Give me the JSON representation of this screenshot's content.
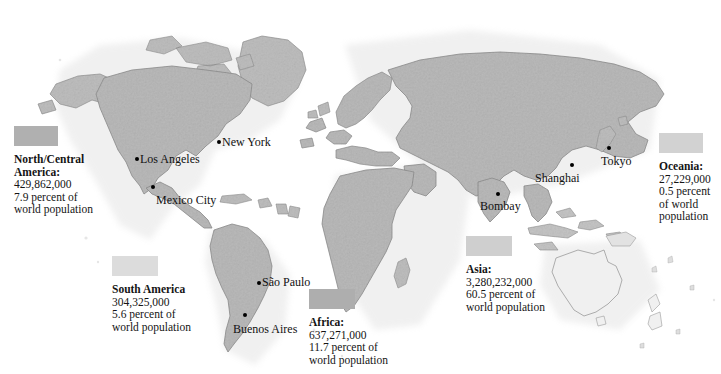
{
  "page": {
    "cut_caption": "percent of world population",
    "background_color": "#fefefe"
  },
  "map": {
    "title": "World population by continent",
    "land_fill": "#b9b9b9",
    "land_stroke": "#8b8b8b",
    "oceania_fill": "#f0f0f0",
    "sea_fill": "#ffffff"
  },
  "legends": [
    {
      "key": "north-central-america",
      "swatch_color": "#b0b0b0",
      "swatch_width": 44,
      "name": "North/Central\nAmerica:",
      "population": "429,862,000",
      "percent": "7.9 percent of",
      "percent_cont": "world population",
      "left": 14,
      "top": 126,
      "width": 92
    },
    {
      "key": "south-america",
      "swatch_color": "#dcdcdc",
      "swatch_width": 46,
      "name": "South America",
      "population": "304,325,000",
      "percent": "5.6 percent of",
      "percent_cont": "world population",
      "left": 112,
      "top": 256,
      "width": 96
    },
    {
      "key": "africa",
      "swatch_color": "#aeaeae",
      "swatch_width": 46,
      "name": "Africa:",
      "population": "637,271,000",
      "percent": "11.7 percent of",
      "percent_cont": "world population",
      "left": 309,
      "top": 289,
      "width": 98
    },
    {
      "key": "asia",
      "swatch_color": "#cfcfcf",
      "swatch_width": 46,
      "name": "Asia:",
      "population": "3,280,232,000",
      "percent": "60.5 percent of",
      "percent_cont": "world population",
      "left": 466,
      "top": 236,
      "width": 100
    },
    {
      "key": "oceania",
      "swatch_color": "#d2d2d2",
      "swatch_width": 44,
      "name": "Oceania:",
      "population": "27,229,000",
      "percent": "0.5 percent",
      "percent_cont": "of world\npopulation",
      "left": 659,
      "top": 133,
      "width": 58
    }
  ],
  "cities": [
    {
      "key": "new-york",
      "label": "New York",
      "left": 222,
      "top": 134,
      "side": "right",
      "dot_x": 217,
      "dot_y": 140
    },
    {
      "key": "los-angeles",
      "label": "Los Angeles",
      "left": 140,
      "top": 151,
      "side": "right",
      "dot_x": 135,
      "dot_y": 157
    },
    {
      "key": "mexico-city",
      "label": "Mexico City",
      "left": 156,
      "top": 192,
      "side": "right",
      "dot_x": 151,
      "dot_y": 185
    },
    {
      "key": "sao-paulo",
      "label": "São Paulo",
      "left": 262,
      "top": 274,
      "side": "right",
      "dot_x": 257,
      "dot_y": 281
    },
    {
      "key": "buenos-aires",
      "label": "Buenos Aires",
      "left": 233,
      "top": 321,
      "side": "right",
      "dot_x": 243,
      "dot_y": 313
    },
    {
      "key": "bombay",
      "label": "Bombay",
      "left": 480,
      "top": 198,
      "side": "right",
      "dot_x": 496,
      "dot_y": 192
    },
    {
      "key": "shanghai",
      "label": "Shanghai",
      "left": 535,
      "top": 170,
      "side": "right",
      "dot_x": 570,
      "dot_y": 163
    },
    {
      "key": "tokyo",
      "label": "Tokyo",
      "left": 601,
      "top": 153,
      "side": "right",
      "dot_x": 607,
      "dot_y": 146
    }
  ],
  "chart_data": {
    "type": "map",
    "categories": [
      "North/Central America",
      "South America",
      "Africa",
      "Asia",
      "Oceania"
    ],
    "values_population": [
      429862000,
      304325000,
      637271000,
      3280232000,
      27229000
    ],
    "values_percent": [
      7.9,
      5.6,
      11.7,
      60.5,
      0.5
    ],
    "unit": "people",
    "labelled_cities": [
      "New York",
      "Los Angeles",
      "Mexico City",
      "São Paulo",
      "Buenos Aires",
      "Bombay",
      "Shanghai",
      "Tokyo"
    ]
  }
}
